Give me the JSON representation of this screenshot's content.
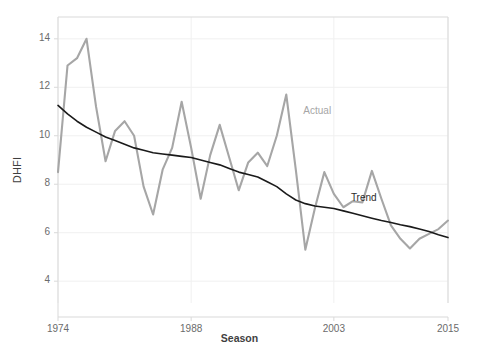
{
  "chart_data": {
    "type": "line",
    "title": "",
    "subtitle": "",
    "xlabel": "Season",
    "ylabel": "DHFI",
    "xlim": [
      1974,
      2015
    ],
    "ylim": [
      3.1,
      14.9
    ],
    "xticks": [
      1974,
      1988,
      2003,
      2015
    ],
    "xtick_labels": [
      "1974",
      "1988",
      "2003",
      "2015"
    ],
    "yticks": [
      4,
      6,
      8,
      10,
      12,
      14
    ],
    "ytick_labels": [
      "4",
      "6",
      "8",
      "10",
      "12",
      "14"
    ],
    "grid": "both-light",
    "legend_position": "inline-annotation",
    "x": [
      1974,
      1975,
      1976,
      1977,
      1978,
      1979,
      1980,
      1981,
      1982,
      1983,
      1984,
      1985,
      1986,
      1987,
      1988,
      1989,
      1990,
      1991,
      1992,
      1993,
      1994,
      1995,
      1996,
      1997,
      1998,
      1999,
      2000,
      2001,
      2002,
      2003,
      2004,
      2005,
      2006,
      2007,
      2008,
      2009,
      2010,
      2011,
      2012,
      2013,
      2014,
      2015
    ],
    "series": [
      {
        "name": "Actual",
        "color": "#a6a6a6",
        "label_x": 2000,
        "label_y": 11.0,
        "values": [
          8.5,
          12.9,
          13.2,
          14.0,
          11.2,
          8.95,
          10.2,
          10.6,
          10.0,
          7.9,
          6.75,
          8.6,
          9.5,
          11.4,
          9.5,
          7.4,
          9.2,
          10.45,
          9.1,
          7.75,
          8.9,
          9.3,
          8.75,
          10.0,
          11.7,
          8.6,
          5.3,
          7.0,
          8.5,
          7.6,
          7.05,
          7.3,
          7.25,
          8.55,
          7.4,
          6.3,
          5.75,
          5.35,
          5.75,
          5.95,
          6.15,
          6.5
        ]
      },
      {
        "name": "Trend",
        "color": "#1a1a1a",
        "label_x": 2005,
        "label_y": 7.4,
        "values": [
          11.25,
          10.9,
          10.6,
          10.35,
          10.15,
          9.95,
          9.8,
          9.65,
          9.5,
          9.4,
          9.3,
          9.25,
          9.2,
          9.15,
          9.1,
          9.0,
          8.9,
          8.8,
          8.65,
          8.5,
          8.4,
          8.3,
          8.1,
          7.9,
          7.6,
          7.35,
          7.2,
          7.1,
          7.05,
          7.0,
          6.9,
          6.8,
          6.7,
          6.6,
          6.5,
          6.42,
          6.33,
          6.25,
          6.15,
          6.05,
          5.92,
          5.8
        ]
      }
    ],
    "actual_tail": {
      "note": "late-series actual excursion",
      "x": [
        2009,
        2010,
        2011,
        2012,
        2013,
        2014,
        2015
      ],
      "values": [
        6.3,
        5.75,
        5.35,
        5.75,
        5.95,
        6.15,
        6.5
      ]
    },
    "annotations": [
      {
        "text": "Actual",
        "color": "#a6a6a6"
      },
      {
        "text": "Trend",
        "color": "#2b2b2b"
      }
    ]
  },
  "axis": {
    "y_title": "DHFI",
    "x_title": "Season",
    "y_ticks": [
      "14",
      "12",
      "10",
      "8",
      "6",
      "4"
    ],
    "x_ticks": [
      "1974",
      "1988",
      "2003",
      "2015"
    ]
  },
  "labels": {
    "actual": "Actual",
    "trend": "Trend"
  },
  "colors": {
    "actual_line": "#a6a6a6",
    "trend_line": "#1a1a1a",
    "grid": "#f0f0f0",
    "axis": "#d9d9d9",
    "tick_text": "#6b6b6b",
    "background": "#ffffff"
  }
}
